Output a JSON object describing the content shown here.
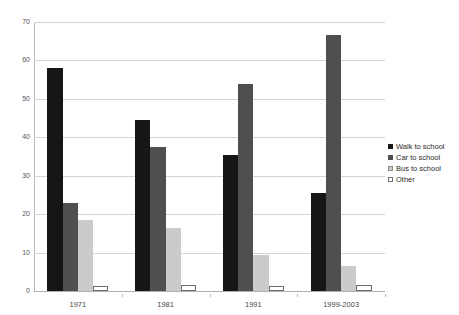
{
  "chart_data": {
    "type": "bar",
    "title": "",
    "subtitle": "",
    "xlabel": "",
    "ylabel": "",
    "categories": [
      "1971",
      "1981",
      "1991",
      "1999-2003"
    ],
    "series": [
      {
        "name": "Walk to school",
        "color": "#161616",
        "values": [
          58,
          44.5,
          35.5,
          25.5
        ]
      },
      {
        "name": "Car to school",
        "color": "#4f4f4f",
        "values": [
          23,
          37.5,
          54,
          66.5
        ]
      },
      {
        "name": "Bus to school",
        "color": "#cbcbcb",
        "values": [
          18.5,
          16.5,
          9.5,
          6.5
        ]
      },
      {
        "name": "Other",
        "color": "#ffffff",
        "values": [
          1.2,
          1.5,
          1.3,
          1.5
        ]
      }
    ],
    "ylim": [
      0,
      70
    ],
    "yticks": [
      0,
      10,
      20,
      30,
      40,
      50,
      60,
      70
    ],
    "ytick_labels": [
      "0",
      "10",
      "20",
      "30",
      "40",
      "50",
      "60",
      "70"
    ],
    "grid": true,
    "grid_axis": "y",
    "legend_position": "right",
    "background": "#ffffff",
    "gridline_color": "#d4d4d4",
    "axis_color": "#b9b9b9"
  }
}
